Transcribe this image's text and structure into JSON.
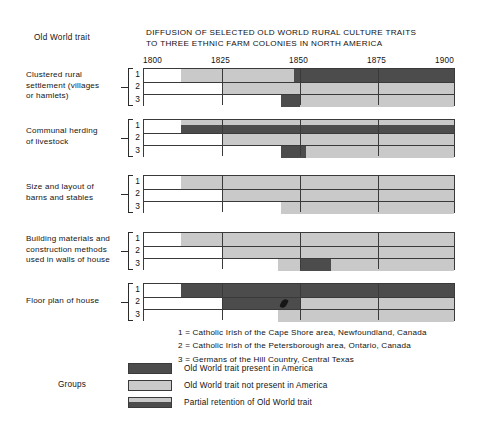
{
  "header": {
    "old_world_trait_label": "Old World trait",
    "title_line1": "DIFFUSION OF SELECTED OLD WORLD RURAL CULTURE TRAITS",
    "title_line2": "TO THREE ETHNIC FARM COLONIES IN NORTH AMERICA"
  },
  "footnotes": [
    "1 = Catholic Irish of the Cape Shore area, Newfoundland, Canada",
    "2 = Catholic Irish of the Petersborough area, Ontario, Canada",
    "3 = Germans of the Hill Country, Central Texas"
  ],
  "legend": {
    "title": "Groups",
    "items": [
      {
        "key": "present",
        "label": "Old World trait present in America",
        "color": "#4c4c4c"
      },
      {
        "key": "absent",
        "label": "Old World trait not present in America",
        "color": "#cacaca"
      },
      {
        "key": "partial",
        "label": "Partial retention of Old World trait",
        "color": "#4c4c4c"
      }
    ]
  },
  "chart_data": {
    "type": "bar",
    "title": "DIFFUSION OF SELECTED OLD WORLD RURAL CULTURE TRAITS TO THREE ETHNIC FARM COLONIES IN NORTH AMERICA",
    "xlabel": "",
    "ylabel": "Old World trait",
    "xlim": [
      1800,
      1900
    ],
    "xticks": [
      1800,
      1825,
      1850,
      1875,
      1900
    ],
    "xtick_labels": [
      "1800",
      "1825",
      "1850",
      "1875",
      "1900"
    ],
    "grid": true,
    "legend_position": "bottom-left",
    "state_colors": {
      "none": "#ffffff",
      "absent": "#c9c9c9",
      "present": "#4c4c4c",
      "partial": "#c9c9c9"
    },
    "group_keys": [
      "1",
      "2",
      "3"
    ],
    "groups": [
      {
        "trait": "Clustered rural settlement (villages or hamlets)",
        "trait_lines": [
          "Clustered rural",
          "settlement (villages",
          "or hamlets)"
        ],
        "rows": [
          {
            "key": "1",
            "segments": [
              {
                "state": "absent",
                "start": 1812,
                "end": 1848
              },
              {
                "state": "present",
                "start": 1848,
                "end": 1900
              }
            ]
          },
          {
            "key": "2",
            "segments": [
              {
                "state": "absent",
                "start": 1825,
                "end": 1900
              }
            ]
          },
          {
            "key": "3",
            "segments": [
              {
                "state": "present",
                "start": 1844,
                "end": 1850
              },
              {
                "state": "absent",
                "start": 1850,
                "end": 1900
              }
            ]
          }
        ]
      },
      {
        "trait": "Communal herding of livestock",
        "trait_lines": [
          "Communal herding",
          "of livestock"
        ],
        "rows": [
          {
            "key": "1",
            "segments": [
              {
                "state": "partial",
                "start": 1812,
                "end": 1900
              }
            ]
          },
          {
            "key": "2",
            "segments": [
              {
                "state": "absent",
                "start": 1825,
                "end": 1900
              }
            ]
          },
          {
            "key": "3",
            "segments": [
              {
                "state": "present",
                "start": 1844,
                "end": 1852
              },
              {
                "state": "absent",
                "start": 1852,
                "end": 1900
              }
            ]
          }
        ]
      },
      {
        "trait": "Size and layout of barns and stables",
        "trait_lines": [
          "Size and layout of",
          "barns and stables"
        ],
        "rows": [
          {
            "key": "1",
            "segments": [
              {
                "state": "absent",
                "start": 1812,
                "end": 1900
              }
            ]
          },
          {
            "key": "2",
            "segments": [
              {
                "state": "absent",
                "start": 1825,
                "end": 1900
              }
            ]
          },
          {
            "key": "3",
            "segments": [
              {
                "state": "absent",
                "start": 1844,
                "end": 1900
              }
            ]
          }
        ]
      },
      {
        "trait": "Building materials and construction methods used in walls of house",
        "trait_lines": [
          "Building materials and",
          "construction methods",
          "used in walls of house"
        ],
        "rows": [
          {
            "key": "1",
            "segments": [
              {
                "state": "absent",
                "start": 1812,
                "end": 1900
              }
            ]
          },
          {
            "key": "2",
            "segments": [
              {
                "state": "absent",
                "start": 1825,
                "end": 1900
              }
            ]
          },
          {
            "key": "3",
            "segments": [
              {
                "state": "absent",
                "start": 1843,
                "end": 1850
              },
              {
                "state": "present",
                "start": 1850,
                "end": 1860
              },
              {
                "state": "absent",
                "start": 1860,
                "end": 1900
              }
            ]
          }
        ]
      },
      {
        "trait": "Floor plan of house",
        "trait_lines": [
          "Floor plan of house"
        ],
        "rows": [
          {
            "key": "1",
            "segments": [
              {
                "state": "present",
                "start": 1812,
                "end": 1900
              }
            ]
          },
          {
            "key": "2",
            "segments": [
              {
                "state": "present",
                "start": 1825,
                "end": 1850
              },
              {
                "state": "absent",
                "start": 1850,
                "end": 1900
              }
            ]
          },
          {
            "key": "3",
            "segments": [
              {
                "state": "absent",
                "start": 1843,
                "end": 1900
              }
            ]
          }
        ]
      }
    ]
  }
}
